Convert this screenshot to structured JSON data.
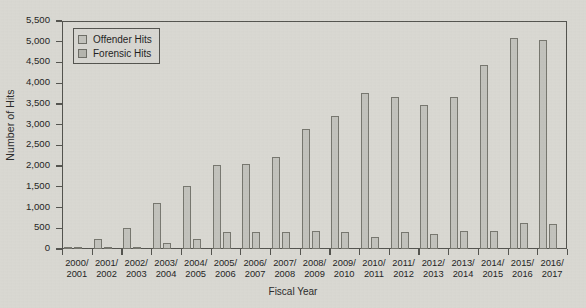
{
  "chart_data": {
    "type": "bar",
    "title": "",
    "xlabel": "Fiscal Year",
    "ylabel": "Number of Hits",
    "ylim": [
      0,
      5500
    ],
    "ytick_labels": [
      "5,500",
      "5,000",
      "4,500",
      "4,000",
      "3,500",
      "3,000",
      "2,500",
      "2,000",
      "1,500",
      "1,000",
      "500",
      "0"
    ],
    "ytick_values": [
      5500,
      5000,
      4500,
      4000,
      3500,
      3000,
      2500,
      2000,
      1500,
      1000,
      500,
      0
    ],
    "grid": false,
    "legend_position": "top-left-inside",
    "categories": [
      "2000/\n2001",
      "2001/\n2002",
      "2002/\n2003",
      "2003/\n2004",
      "2004/\n2005",
      "2005/\n2006",
      "2006/\n2007",
      "2007/\n2008",
      "2008/\n2009",
      "2009/\n2010",
      "2010/\n2011",
      "2011/\n2012",
      "2012/\n2013",
      "2013/\n2014",
      "2014/\n2015",
      "2015/\n2016",
      "2016/\n2017"
    ],
    "series": [
      {
        "name": "Offender Hits",
        "values": [
          30,
          230,
          510,
          1120,
          1520,
          2020,
          2040,
          2220,
          2900,
          3200,
          3760,
          3660,
          3470,
          3670,
          4440,
          5100,
          5050
        ]
      },
      {
        "name": "Forensic Hits",
        "values": [
          10,
          50,
          60,
          140,
          230,
          400,
          420,
          400,
          430,
          420,
          300,
          400,
          360,
          430,
          440,
          620,
          600
        ]
      }
    ]
  },
  "legend": {
    "items": [
      {
        "label": "Offender Hits"
      },
      {
        "label": "Forensic Hits"
      }
    ]
  },
  "colors": {
    "bar_fill": "#c2c2bc",
    "bar_stroke": "#77776f",
    "axis": "#54544f",
    "background": "#d9d8d2",
    "text": "#242424"
  }
}
